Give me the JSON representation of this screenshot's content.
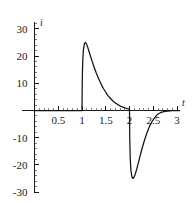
{
  "chart_data": {
    "type": "line",
    "title": "",
    "subtitle": "",
    "xlabel": "t",
    "ylabel": "i",
    "xlim": [
      0,
      3.12
    ],
    "ylim": [
      -32,
      32
    ],
    "grid": false,
    "legend": null,
    "x_ticks": [
      0.5,
      1,
      1.5,
      2,
      2.5,
      3
    ],
    "x_tick_labels": [
      "0.5",
      "1",
      "1.5",
      "2",
      "2.5",
      "3"
    ],
    "x_minor_tick_step": 0.1,
    "y_ticks": [
      -30,
      -20,
      -10,
      10,
      20,
      30
    ],
    "y_tick_labels": [
      "-30",
      "-20",
      "-10",
      "10",
      "20",
      "30"
    ],
    "y_minor_tick_step": 2,
    "series": [
      {
        "name": "i(t)",
        "color": "#111111",
        "annotations": [
          "zero for 0 <= t < 1",
          "jump up to +25 at t = 1, exponential decay to ~0 by t = 2",
          "jump down to -25 at t = 2, exponential rise back to ~0 by t = 2.6"
        ],
        "points": [
          [
            0.0,
            0
          ],
          [
            0.1,
            0
          ],
          [
            0.2,
            0
          ],
          [
            0.3,
            0
          ],
          [
            0.4,
            0
          ],
          [
            0.5,
            0
          ],
          [
            0.6,
            0
          ],
          [
            0.7,
            0
          ],
          [
            0.8,
            0
          ],
          [
            0.9,
            0
          ],
          [
            1.0,
            0
          ],
          [
            1.005,
            10.5
          ],
          [
            1.015,
            18.0
          ],
          [
            1.03,
            22.4
          ],
          [
            1.05,
            24.6
          ],
          [
            1.07,
            25.0
          ],
          [
            1.09,
            24.6
          ],
          [
            1.12,
            23.3
          ],
          [
            1.15,
            21.6
          ],
          [
            1.2,
            18.8
          ],
          [
            1.25,
            16.2
          ],
          [
            1.3,
            13.8
          ],
          [
            1.35,
            11.7
          ],
          [
            1.4,
            9.8
          ],
          [
            1.45,
            8.1
          ],
          [
            1.5,
            6.7
          ],
          [
            1.55,
            5.4
          ],
          [
            1.6,
            4.4
          ],
          [
            1.65,
            3.5
          ],
          [
            1.7,
            2.8
          ],
          [
            1.75,
            2.2
          ],
          [
            1.8,
            1.7
          ],
          [
            1.85,
            1.3
          ],
          [
            1.9,
            1.0
          ],
          [
            1.95,
            0.7
          ],
          [
            2.0,
            0.5
          ],
          [
            2.005,
            -10.0
          ],
          [
            2.015,
            -17.5
          ],
          [
            2.03,
            -22.0
          ],
          [
            2.05,
            -24.3
          ],
          [
            2.07,
            -25.0
          ],
          [
            2.09,
            -24.7
          ],
          [
            2.12,
            -23.4
          ],
          [
            2.15,
            -21.7
          ],
          [
            2.18,
            -19.7
          ],
          [
            2.21,
            -17.6
          ],
          [
            2.25,
            -14.9
          ],
          [
            2.29,
            -12.4
          ],
          [
            2.33,
            -10.1
          ],
          [
            2.37,
            -8.1
          ],
          [
            2.41,
            -6.3
          ],
          [
            2.45,
            -4.8
          ],
          [
            2.49,
            -3.6
          ],
          [
            2.53,
            -2.6
          ],
          [
            2.57,
            -1.8
          ],
          [
            2.61,
            -1.2
          ],
          [
            2.65,
            -0.8
          ],
          [
            2.7,
            -0.5
          ],
          [
            2.75,
            -0.3
          ],
          [
            2.8,
            -0.2
          ],
          [
            2.85,
            -0.1
          ],
          [
            2.9,
            -0.05
          ],
          [
            2.95,
            0
          ],
          [
            3.0,
            0
          ],
          [
            3.05,
            0
          ]
        ]
      }
    ]
  },
  "axis": {
    "y_axis_name": "i",
    "x_axis_name": "t"
  }
}
